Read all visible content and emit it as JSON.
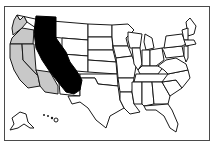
{
  "map": {
    "title": "United States map",
    "highlighted_overlay": "California (enlarged, shown in black)",
    "shaded_states": [
      "Washington",
      "Oregon",
      "California",
      "Nevada",
      "Arizona"
    ],
    "colors": {
      "overlay": "#000000",
      "shaded": "#c8c8c8",
      "default": "#ffffff",
      "border": "#1a1a1a",
      "frame": "#4a4a4a"
    },
    "insets": [
      "Alaska",
      "Hawaii"
    ]
  }
}
